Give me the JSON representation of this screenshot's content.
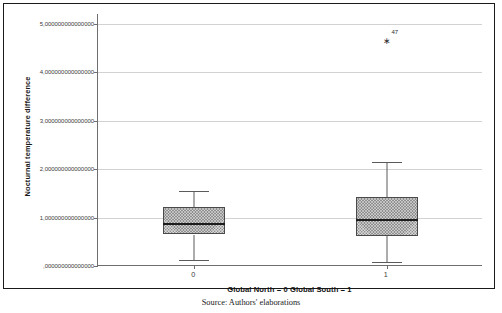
{
  "chart_data": {
    "type": "box",
    "title": "",
    "xlabel": "Global North = 0 Global South = 1",
    "ylabel": "Nocturnal temperature difference",
    "ylim": [
      0,
      5.2
    ],
    "grid": true,
    "legend": "none",
    "categories": [
      "0",
      "1"
    ],
    "y_ticks": [
      {
        "value": 0,
        "label": ",000000000000000"
      },
      {
        "value": 1,
        "label": "1,000000000000000"
      },
      {
        "value": 2,
        "label": "2,000000000000000"
      },
      {
        "value": 3,
        "label": "3,000000000000000"
      },
      {
        "value": 4,
        "label": "4,000000000000000"
      },
      {
        "value": 5,
        "label": "5,000000000000000"
      }
    ],
    "boxes": [
      {
        "category": "0",
        "group_name": "Global North",
        "whisker_low": 0.12,
        "q1": 0.65,
        "median": 0.88,
        "q3": 1.22,
        "whisker_high": 1.55,
        "outliers": []
      },
      {
        "category": "1",
        "group_name": "Global South",
        "whisker_low": 0.08,
        "q1": 0.62,
        "median": 0.97,
        "q3": 1.42,
        "whisker_high": 2.15,
        "outliers": [
          {
            "value": 4.62,
            "label": "47",
            "marker": "asterisk"
          }
        ]
      }
    ]
  },
  "caption": {
    "text": "Source: Authors' elaborations"
  },
  "colors": {
    "box_fill": "#8f8f8f",
    "box_border": "#4a4a4a",
    "median": "#1c1c1c",
    "whisker": "#5b5b5b",
    "gridline": "#d2d2d2",
    "axis": "#6e6e6e",
    "frame": "#1a1a1a"
  }
}
